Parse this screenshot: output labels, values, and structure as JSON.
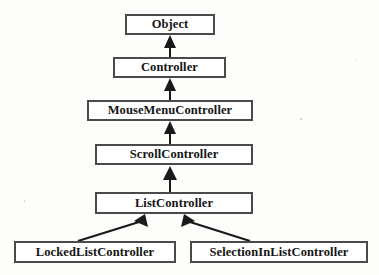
{
  "diagram": {
    "type": "uml-class-inheritance",
    "background_color": "#fdfdfb",
    "box_fill_color": "#ffffff",
    "box_border_color": "#4a4a4a",
    "text_color": "#141414",
    "edge_color": "#1a1a1a",
    "classes": [
      {
        "id": "object",
        "label": "Object",
        "x": 125,
        "y": 14,
        "width": 90,
        "height": 21,
        "font_size": 12.5
      },
      {
        "id": "controller",
        "label": "Controller",
        "x": 113,
        "y": 57,
        "width": 113,
        "height": 21,
        "font_size": 12.5
      },
      {
        "id": "mousemenucontroller",
        "label": "MouseMenuController",
        "x": 87,
        "y": 100,
        "width": 166,
        "height": 21,
        "font_size": 12.5
      },
      {
        "id": "scrollcontroller",
        "label": "ScrollController",
        "x": 95,
        "y": 144,
        "width": 158,
        "height": 21,
        "font_size": 12.5
      },
      {
        "id": "listcontroller",
        "label": "ListController",
        "x": 95,
        "y": 192,
        "width": 158,
        "height": 22,
        "font_size": 12.5
      },
      {
        "id": "lockedlistcontroller",
        "label": "LockedListController",
        "x": 14,
        "y": 241,
        "width": 162,
        "height": 22,
        "font_size": 12.5
      },
      {
        "id": "selectioninlistcontroller",
        "label": "SelectionInListController",
        "x": 190,
        "y": 241,
        "width": 178,
        "height": 22,
        "font_size": 12.5
      }
    ],
    "edges": [
      {
        "id": "edge-controller-object",
        "from": "controller",
        "to": "object",
        "kind": "generalization",
        "arrow": "filled-triangle-up",
        "shape": "vertical",
        "x": 170,
        "from_y": 57,
        "to_y": 35
      },
      {
        "id": "edge-mousemenucontroller-controller",
        "from": "mousemenucontroller",
        "to": "controller",
        "kind": "generalization",
        "arrow": "filled-triangle-up",
        "shape": "vertical",
        "x": 170,
        "from_y": 100,
        "to_y": 78
      },
      {
        "id": "edge-scrollcontroller-mousemenucontroller",
        "from": "scrollcontroller",
        "to": "mousemenucontroller",
        "kind": "generalization",
        "arrow": "filled-triangle-up",
        "shape": "vertical",
        "x": 170,
        "from_y": 144,
        "to_y": 121
      },
      {
        "id": "edge-listcontroller-scrollcontroller",
        "from": "listcontroller",
        "to": "scrollcontroller",
        "kind": "generalization",
        "arrow": "filled-triangle-up",
        "shape": "vertical",
        "x": 170,
        "from_y": 192,
        "to_y": 165
      },
      {
        "id": "edge-lockedlistcontroller-listcontroller",
        "from": "lockedlistcontroller",
        "to": "listcontroller",
        "kind": "generalization",
        "arrow": "filled-triangle-up",
        "shape": "diagonal",
        "from_x": 76,
        "from_y": 241,
        "to_x": 143,
        "to_y": 214
      },
      {
        "id": "edge-selectioninlistcontroller-listcontroller",
        "from": "selectioninlistcontroller",
        "to": "listcontroller",
        "kind": "generalization",
        "arrow": "filled-triangle-up",
        "shape": "diagonal",
        "from_x": 252,
        "from_y": 241,
        "to_x": 186,
        "to_y": 214
      }
    ]
  }
}
